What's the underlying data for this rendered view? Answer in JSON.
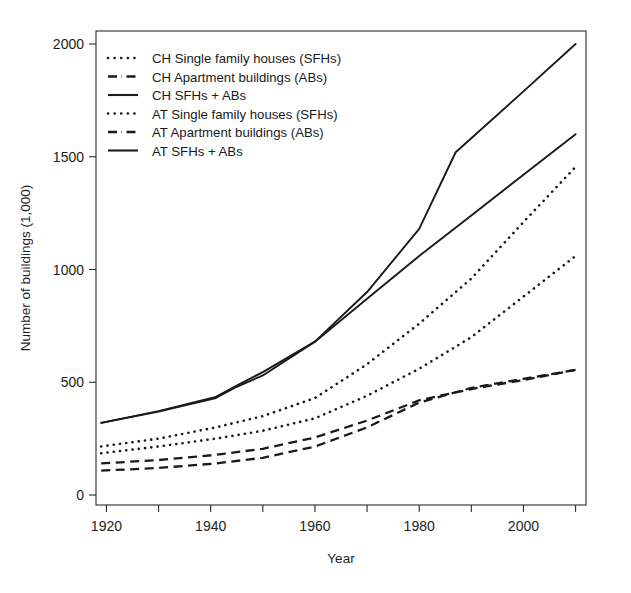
{
  "chart_data": {
    "type": "line",
    "title": "",
    "xlabel": "Year",
    "ylabel": "Number of buildings (1,000)",
    "xlim": [
      1918,
      2012
    ],
    "ylim": [
      0,
      2100
    ],
    "grid": false,
    "legend_position": "top-left",
    "x_ticks": [
      1920,
      1930,
      1940,
      1950,
      1960,
      1970,
      1980,
      1990,
      2000,
      2010
    ],
    "x_tick_labels": [
      "1920",
      "",
      "1940",
      "",
      "1960",
      "",
      "1980",
      "",
      "2000",
      ""
    ],
    "y_ticks": [
      0,
      500,
      1000,
      1500,
      2000
    ],
    "y_tick_labels": [
      "0",
      "500",
      "1000",
      "1500",
      "2000"
    ],
    "series": [
      {
        "name": "CH Single family houses (SFHs)",
        "style": "dotted",
        "x": [
          1919,
          1930,
          1941,
          1950,
          1960,
          1970,
          1980,
          1990,
          2000,
          2010
        ],
        "values": [
          185,
          215,
          250,
          285,
          340,
          440,
          560,
          700,
          880,
          1060
        ]
      },
      {
        "name": "CH Apartment buildings (ABs)",
        "style": "dashed",
        "x": [
          1919,
          1930,
          1941,
          1950,
          1960,
          1970,
          1980,
          1990,
          2000,
          2010
        ],
        "values": [
          140,
          155,
          178,
          205,
          255,
          330,
          420,
          470,
          510,
          555
        ]
      },
      {
        "name": "CH SFHs + ABs",
        "style": "solid",
        "x": [
          1919,
          1930,
          1941,
          1945,
          1950,
          1960,
          1970,
          1980,
          1990,
          2000,
          2010
        ],
        "values": [
          320,
          370,
          430,
          480,
          530,
          680,
          870,
          1060,
          1240,
          1420,
          1600
        ]
      },
      {
        "name": "AT Single family houses (SFHs)",
        "style": "dotted",
        "x": [
          1919,
          1930,
          1941,
          1950,
          1960,
          1970,
          1980,
          1990,
          2000,
          2010
        ],
        "values": [
          215,
          250,
          300,
          350,
          430,
          580,
          760,
          960,
          1210,
          1455
        ]
      },
      {
        "name": "AT Apartment buildings (ABs)",
        "style": "dashed",
        "x": [
          1919,
          1930,
          1941,
          1950,
          1960,
          1970,
          1980,
          1990,
          2000,
          2010
        ],
        "values": [
          108,
          120,
          140,
          165,
          215,
          300,
          410,
          475,
          515,
          555
        ]
      },
      {
        "name": "AT SFHs + ABs",
        "style": "solid",
        "x": [
          1919,
          1930,
          1941,
          1945,
          1950,
          1960,
          1970,
          1980,
          1987,
          2000,
          2010
        ],
        "values": [
          320,
          372,
          435,
          485,
          545,
          680,
          900,
          1180,
          1520,
          1790,
          2000
        ]
      }
    ]
  },
  "legend": {
    "items": [
      {
        "label": "CH Single family houses (SFHs)",
        "style": "dotted"
      },
      {
        "label": "CH Apartment buildings (ABs)",
        "style": "dashed"
      },
      {
        "label": "CH SFHs + ABs",
        "style": "solid"
      },
      {
        "label": "AT Single family houses (SFHs)",
        "style": "dotted"
      },
      {
        "label": "AT Apartment buildings (ABs)",
        "style": "dashed"
      },
      {
        "label": "AT SFHs + ABs",
        "style": "solid"
      }
    ]
  },
  "colors": {
    "line": "#1a1a1a",
    "axis": "#2b2b2b",
    "background": "#ffffff"
  }
}
